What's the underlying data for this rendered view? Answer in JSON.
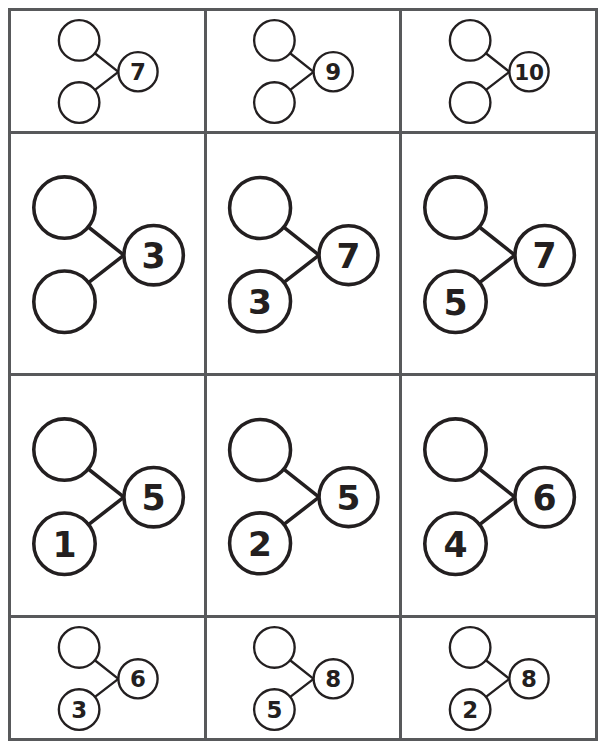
{
  "worksheet": {
    "title": "Number Bonds Worksheet",
    "layout": {
      "rows": 4,
      "columns": 3
    },
    "colors": {
      "page_background": "#ffffff",
      "grid_line": "#58595b",
      "circle_stroke": "#231f20",
      "circle_fill": "#ffffff",
      "digit": "#231f20"
    }
  },
  "cells": [
    {
      "id": "cell-r1c1",
      "row": 1,
      "column": 1,
      "part_top": "",
      "part_bottom": "",
      "whole": "7",
      "part_top_filled": false,
      "part_bottom_filled": false,
      "whole_filled": true
    },
    {
      "id": "cell-r1c2",
      "row": 1,
      "column": 2,
      "part_top": "",
      "part_bottom": "",
      "whole": "9",
      "part_top_filled": false,
      "part_bottom_filled": false,
      "whole_filled": true
    },
    {
      "id": "cell-r1c3",
      "row": 1,
      "column": 3,
      "part_top": "",
      "part_bottom": "",
      "whole": "10",
      "part_top_filled": false,
      "part_bottom_filled": false,
      "whole_filled": true
    },
    {
      "id": "cell-r2c1",
      "row": 2,
      "column": 1,
      "part_top": "",
      "part_bottom": "",
      "whole": "3",
      "part_top_filled": false,
      "part_bottom_filled": false,
      "whole_filled": true
    },
    {
      "id": "cell-r2c2",
      "row": 2,
      "column": 2,
      "part_top": "",
      "part_bottom": "3",
      "whole": "7",
      "part_top_filled": false,
      "part_bottom_filled": true,
      "whole_filled": true
    },
    {
      "id": "cell-r2c3",
      "row": 2,
      "column": 3,
      "part_top": "",
      "part_bottom": "5",
      "whole": "7",
      "part_top_filled": false,
      "part_bottom_filled": true,
      "whole_filled": true
    },
    {
      "id": "cell-r3c1",
      "row": 3,
      "column": 1,
      "part_top": "",
      "part_bottom": "1",
      "whole": "5",
      "part_top_filled": false,
      "part_bottom_filled": true,
      "whole_filled": true
    },
    {
      "id": "cell-r3c2",
      "row": 3,
      "column": 2,
      "part_top": "",
      "part_bottom": "2",
      "whole": "5",
      "part_top_filled": false,
      "part_bottom_filled": true,
      "whole_filled": true
    },
    {
      "id": "cell-r3c3",
      "row": 3,
      "column": 3,
      "part_top": "",
      "part_bottom": "4",
      "whole": "6",
      "part_top_filled": false,
      "part_bottom_filled": true,
      "whole_filled": true
    },
    {
      "id": "cell-r4c1",
      "row": 4,
      "column": 1,
      "part_top": "",
      "part_bottom": "3",
      "whole": "6",
      "part_top_filled": false,
      "part_bottom_filled": true,
      "whole_filled": true
    },
    {
      "id": "cell-r4c2",
      "row": 4,
      "column": 2,
      "part_top": "",
      "part_bottom": "5",
      "whole": "8",
      "part_top_filled": false,
      "part_bottom_filled": true,
      "whole_filled": true
    },
    {
      "id": "cell-r4c3",
      "row": 4,
      "column": 3,
      "part_top": "",
      "part_bottom": "2",
      "whole": "8",
      "part_top_filled": false,
      "part_bottom_filled": true,
      "whole_filled": true
    }
  ]
}
